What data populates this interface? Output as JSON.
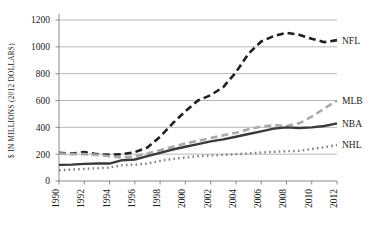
{
  "chart_data": {
    "type": "line",
    "title": "",
    "xlabel": "",
    "ylabel": "$ IN MILLIONS (2012 DOLLARS)",
    "xlim": [
      1990,
      2012
    ],
    "ylim": [
      0,
      1200
    ],
    "ytick_step": 200,
    "xtick_step": 2,
    "grid": true,
    "legend_position": "right-inline",
    "x": [
      1990,
      1991,
      1992,
      1993,
      1994,
      1995,
      1996,
      1997,
      1998,
      1999,
      2000,
      2001,
      2002,
      2003,
      2004,
      2005,
      2006,
      2007,
      2008,
      2009,
      2010,
      2011,
      2012
    ],
    "yticks": [
      0,
      200,
      400,
      600,
      800,
      1000,
      1200
    ],
    "ytick_labels": [
      "0",
      "200",
      "400",
      "600",
      "800",
      "1000",
      "1200"
    ],
    "xticks": [
      1990,
      1992,
      1994,
      1996,
      1998,
      2000,
      2002,
      2004,
      2006,
      2008,
      2010,
      2012
    ],
    "xtick_labels": [
      "1990",
      "1992",
      "1994",
      "1996",
      "1998",
      "2000",
      "2002",
      "2004",
      "2006",
      "2008",
      "2010",
      "2012"
    ],
    "series": [
      {
        "name": "NFL",
        "label": "NFL",
        "color": "#1f1f1f",
        "style": "dashed",
        "width": 2.6,
        "dasharray": "7,4",
        "values": [
          210,
          205,
          215,
          200,
          195,
          200,
          215,
          250,
          330,
          430,
          520,
          600,
          640,
          700,
          810,
          950,
          1040,
          1080,
          1105,
          1090,
          1060,
          1035,
          1050
        ]
      },
      {
        "name": "MLB",
        "label": "MLB",
        "color": "#aaaaaa",
        "style": "dashed",
        "width": 2.6,
        "dasharray": "7,4",
        "values": [
          205,
          200,
          200,
          195,
          185,
          175,
          185,
          205,
          230,
          255,
          280,
          300,
          320,
          340,
          360,
          385,
          405,
          415,
          410,
          430,
          480,
          540,
          600
        ]
      },
      {
        "name": "NBA",
        "label": "NBA",
        "color": "#3a3a3a",
        "style": "solid",
        "width": 2.4,
        "dasharray": "",
        "values": [
          120,
          122,
          128,
          130,
          130,
          155,
          160,
          185,
          210,
          235,
          255,
          275,
          295,
          310,
          330,
          350,
          370,
          390,
          400,
          395,
          400,
          410,
          430
        ]
      },
      {
        "name": "NHL",
        "label": "NHL",
        "color": "#808080",
        "style": "dotted",
        "width": 2.4,
        "dasharray": "1.6,3.2",
        "values": [
          80,
          85,
          90,
          95,
          100,
          118,
          122,
          130,
          150,
          165,
          175,
          185,
          190,
          195,
          200,
          205,
          212,
          218,
          222,
          225,
          238,
          252,
          268
        ]
      }
    ]
  }
}
